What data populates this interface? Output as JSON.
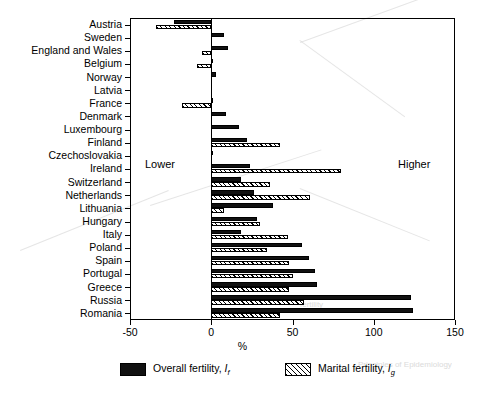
{
  "chart_data": {
    "type": "bar",
    "orientation": "horizontal",
    "title": "",
    "xlabel": "%",
    "ylabel": "",
    "xlim": [
      -50,
      150
    ],
    "xticks": [
      -50,
      0,
      50,
      100,
      150
    ],
    "xticklabels": [
      "-50",
      "0",
      "50",
      "100",
      "150"
    ],
    "grid": false,
    "legend_position": "bottom",
    "annotations": [
      {
        "text": "Lower",
        "x": -33,
        "side": "left"
      },
      {
        "text": "Higher",
        "x": 118,
        "side": "right"
      }
    ],
    "categories": [
      "Austria",
      "Sweden",
      "England and Wales",
      "Belgium",
      "Norway",
      "Latvia",
      "France",
      "Denmark",
      "Luxembourg",
      "Finland",
      "Czechoslovakia",
      "Ireland",
      "Switzerland",
      "Netherlands",
      "Lithuania",
      "Hungary",
      "Italy",
      "Poland",
      "Spain",
      "Portugal",
      "Greece",
      "Russia",
      "Romania"
    ],
    "series": [
      {
        "name": "Overall fertility, If",
        "key": "if",
        "style": "solid-black",
        "values": [
          -23,
          8,
          10,
          1,
          3,
          0,
          1,
          9,
          17,
          22,
          1,
          24,
          18,
          26,
          38,
          28,
          18,
          56,
          60,
          64,
          65,
          123,
          124
        ]
      },
      {
        "name": "Marital fertility, Ig",
        "key": "ig",
        "style": "hatched",
        "values": [
          -34,
          0,
          -6,
          -9,
          0,
          0,
          -18,
          0,
          0,
          42,
          0,
          80,
          36,
          61,
          8,
          30,
          47,
          34,
          48,
          50,
          48,
          57,
          42
        ]
      }
    ]
  },
  "legend": {
    "entries": [
      {
        "label_prefix": "Overall fertility, ",
        "symbol": "I",
        "subscript": "f",
        "swatch": "solid"
      },
      {
        "label_prefix": "Marital fertility, ",
        "symbol": "I",
        "subscript": "g",
        "swatch": "hatch"
      }
    ]
  }
}
